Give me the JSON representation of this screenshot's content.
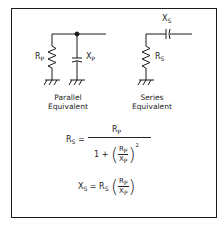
{
  "diagram": {
    "parallel": {
      "resistor_label": "R",
      "resistor_sub": "P",
      "capacitor_label": "X",
      "capacitor_sub": "P",
      "caption_line1": "Parallel",
      "caption_line2": "Equivalent"
    },
    "series": {
      "resistor_label": "R",
      "resistor_sub": "S",
      "capacitor_label": "X",
      "capacitor_sub": "S",
      "caption_line1": "Series",
      "caption_line2": "Equivalent"
    },
    "equation1": {
      "lhs": "R",
      "lhs_sub": "S",
      "equals": "=",
      "numerator": "R",
      "numerator_sub": "P",
      "den_one_plus": "1 +",
      "inner_num": "R",
      "inner_num_sub": "P",
      "inner_den": "X",
      "inner_den_sub": "P",
      "exponent": "2"
    },
    "equation2": {
      "lhs": "X",
      "lhs_sub": "S",
      "equals": "=",
      "rs": "R",
      "rs_sub": "S",
      "inner_num": "R",
      "inner_num_sub": "P",
      "inner_den": "X",
      "inner_den_sub": "P"
    }
  }
}
